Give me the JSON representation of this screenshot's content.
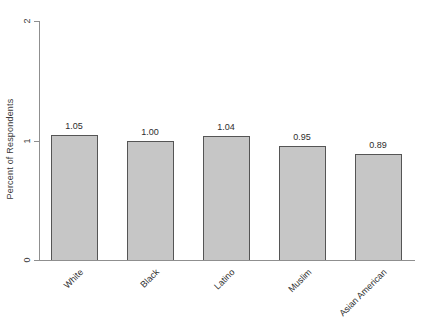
{
  "chart_data": {
    "type": "bar",
    "title": "",
    "categories": [
      "White",
      "Black",
      "Latino",
      "Muslim",
      "Asian American"
    ],
    "values": [
      1.05,
      1.0,
      1.04,
      0.95,
      0.89
    ],
    "value_labels": [
      "1.05",
      "1.00",
      "1.04",
      "0.95",
      "0.89"
    ],
    "xlabel": "",
    "ylabel": "Percent of Respondents",
    "ylim": [
      0,
      2
    ],
    "yticks": [
      0,
      1,
      2
    ],
    "ytick_labels": [
      "0",
      "1",
      "2"
    ],
    "grid": false,
    "legend": null,
    "colors": {
      "bar_fill": "#c6c6c6",
      "bar_border": "#555555",
      "axis": "#8f8f8f",
      "text": "#2e2e2e",
      "background": "#ffffff"
    }
  }
}
